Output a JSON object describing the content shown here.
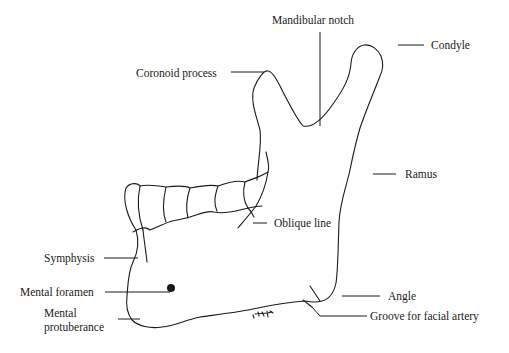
{
  "diagram": {
    "colors": {
      "ink": "#1a1a1a",
      "background": "#ffffff"
    },
    "labels": {
      "mandibular_notch": "Mandibular notch",
      "condyle": "Condyle",
      "coronoid_process": "Coronoid process",
      "ramus": "Ramus",
      "oblique_line": "Oblique line",
      "symphysis": "Symphysis",
      "mental_foramen": "Mental foramen",
      "mental_protuberance_line1": "Mental",
      "mental_protuberance_line2": "protuberance",
      "angle": "Angle",
      "groove_for_facial_artery": "Groove for facial artery"
    }
  }
}
